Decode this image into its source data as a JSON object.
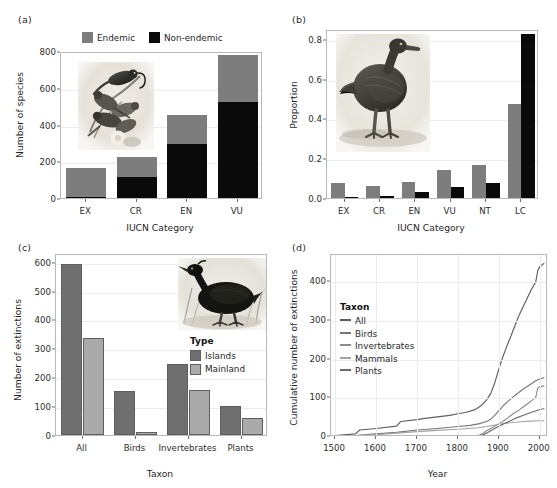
{
  "figure": {
    "panels": [
      "(a)",
      "(b)",
      "(c)",
      "(d)"
    ]
  },
  "colors": {
    "endemic_grey": "#7d7d7d",
    "non_endemic_black": "#0a0a0a",
    "islands_dark": "#6f6f6f",
    "mainland_light": "#aaaaaa",
    "axis": "#b9b9b9",
    "grid": "#ececec",
    "text": "#1f1f1f",
    "line_all": "#5f5f5f",
    "line_birds": "#777777",
    "line_invertebrates": "#8c8c8c",
    "line_mammals": "#a3a3a3",
    "line_plants": "#6a6a6a"
  },
  "panel_a": {
    "label": "(a)",
    "legend": {
      "entries": [
        {
          "label": "Endemic",
          "color": "#7d7d7d"
        },
        {
          "label": "Non-endemic",
          "color": "#0a0a0a"
        }
      ]
    },
    "chart_data": {
      "type": "bar",
      "stacked": true,
      "title": "",
      "xlabel": "IUCN Category",
      "ylabel": "Number of species",
      "categories": [
        "EX",
        "CR",
        "EN",
        "VU"
      ],
      "ylim": [
        0,
        800
      ],
      "yticks": [
        0,
        200,
        400,
        600,
        800
      ],
      "grid": true,
      "legend_position": "top",
      "series": [
        {
          "name": "Non-endemic",
          "color": "#0a0a0a",
          "values": [
            8,
            112,
            292,
            522
          ]
        },
        {
          "name": "Endemic",
          "color": "#7d7d7d",
          "values": [
            155,
            113,
            158,
            255
          ]
        }
      ],
      "totals": [
        163,
        225,
        450,
        777
      ]
    }
  },
  "panel_b": {
    "label": "(b)",
    "chart_data": {
      "type": "bar",
      "stacked": false,
      "grouped": true,
      "title": "",
      "xlabel": "IUCN Category",
      "ylabel": "Proportion",
      "categories": [
        "EX",
        "CR",
        "EN",
        "VU",
        "NT",
        "LC"
      ],
      "ylim": [
        0,
        0.85
      ],
      "yticks": [
        0.0,
        0.2,
        0.4,
        0.6,
        0.8
      ],
      "ytick_labels": [
        "0.0",
        "0.2",
        "0.4",
        "0.6",
        "0.8"
      ],
      "grid": true,
      "series": [
        {
          "name": "Endemic",
          "color": "#7d7d7d",
          "values": [
            0.077,
            0.058,
            0.083,
            0.139,
            0.165,
            0.472
          ]
        },
        {
          "name": "Non-endemic",
          "color": "#0a0a0a",
          "values": [
            0.002,
            0.012,
            0.028,
            0.055,
            0.077,
            0.826
          ]
        }
      ]
    }
  },
  "panel_c": {
    "label": "(c)",
    "legend": {
      "title": "Type",
      "entries": [
        {
          "label": "Islands",
          "color": "#6f6f6f"
        },
        {
          "label": "Mainland",
          "color": "#aaaaaa"
        }
      ]
    },
    "chart_data": {
      "type": "bar",
      "stacked": false,
      "grouped": true,
      "title": "",
      "xlabel": "Taxon",
      "ylabel": "Number of extinctions",
      "categories": [
        "All",
        "Birds",
        "Invertebrates",
        "Plants"
      ],
      "ylim": [
        0,
        630
      ],
      "yticks": [
        0,
        100,
        200,
        300,
        400,
        500,
        600
      ],
      "grid": true,
      "legend_position": "inside-right",
      "series": [
        {
          "name": "Islands",
          "color": "#6f6f6f",
          "values": [
            591,
            153,
            247,
            100
          ]
        },
        {
          "name": "Mainland",
          "color": "#aaaaaa",
          "values": [
            336,
            10,
            155,
            58
          ]
        }
      ]
    }
  },
  "panel_d": {
    "label": "(d)",
    "legend": {
      "title": "Taxon",
      "entries": [
        {
          "label": "All",
          "color": "#5f5f5f"
        },
        {
          "label": "Birds",
          "color": "#777777"
        },
        {
          "label": "Invertebrates",
          "color": "#8c8c8c"
        },
        {
          "label": "Mammals",
          "color": "#a3a3a3"
        },
        {
          "label": "Plants",
          "color": "#6a6a6a"
        }
      ]
    },
    "chart_data": {
      "type": "line",
      "title": "",
      "xlabel": "Year",
      "ylabel": "Cumulative number of extinctions",
      "xlim": [
        1490,
        2020
      ],
      "ylim": [
        0,
        470
      ],
      "xticks": [
        1500,
        1600,
        1700,
        1800,
        1900,
        2000
      ],
      "yticks": [
        0,
        100,
        200,
        300,
        400
      ],
      "grid": true,
      "legend_position": "inside-left",
      "series": [
        {
          "name": "All",
          "color": "#5f5f5f",
          "x": [
            1500,
            1550,
            1560,
            1600,
            1650,
            1660,
            1700,
            1720,
            1750,
            1780,
            1800,
            1820,
            1840,
            1850,
            1860,
            1870,
            1880,
            1890,
            1900,
            1910,
            1920,
            1930,
            1940,
            1950,
            1960,
            1970,
            1980,
            1990,
            1995,
            2000,
            2010
          ],
          "y": [
            4,
            8,
            18,
            22,
            28,
            40,
            45,
            48,
            52,
            56,
            60,
            64,
            70,
            76,
            84,
            96,
            112,
            140,
            176,
            208,
            236,
            262,
            290,
            316,
            338,
            360,
            382,
            400,
            430,
            440,
            448
          ]
        },
        {
          "name": "Birds",
          "color": "#777777",
          "x": [
            1500,
            1550,
            1600,
            1650,
            1700,
            1750,
            1800,
            1830,
            1850,
            1870,
            1880,
            1890,
            1900,
            1910,
            1920,
            1930,
            1940,
            1950,
            1960,
            1970,
            1980,
            1990,
            2000,
            2010
          ],
          "y": [
            2,
            4,
            8,
            12,
            18,
            22,
            27,
            30,
            34,
            40,
            46,
            56,
            68,
            80,
            90,
            99,
            108,
            116,
            124,
            131,
            138,
            145,
            150,
            153
          ]
        },
        {
          "name": "Invertebrates",
          "color": "#8c8c8c",
          "x": [
            1500,
            1600,
            1700,
            1800,
            1830,
            1850,
            1860,
            1870,
            1880,
            1890,
            1900,
            1910,
            1920,
            1930,
            1940,
            1950,
            1960,
            1970,
            1980,
            1990,
            1995,
            2000,
            2010
          ],
          "y": [
            0,
            0,
            0,
            1,
            2,
            4,
            8,
            16,
            22,
            28,
            34,
            40,
            48,
            56,
            64,
            70,
            78,
            86,
            94,
            102,
            126,
            130,
            132
          ]
        },
        {
          "name": "Mammals",
          "color": "#a3a3a3",
          "x": [
            1500,
            1550,
            1600,
            1650,
            1700,
            1750,
            1800,
            1850,
            1870,
            1880,
            1890,
            1900,
            1920,
            1940,
            1960,
            1980,
            2000,
            2010
          ],
          "y": [
            1,
            3,
            6,
            10,
            14,
            17,
            20,
            24,
            27,
            29,
            31,
            33,
            36,
            38,
            40,
            41,
            42,
            42
          ]
        },
        {
          "name": "Plants",
          "color": "#6a6a6a",
          "x": [
            1500,
            1600,
            1700,
            1800,
            1840,
            1860,
            1870,
            1880,
            1890,
            1900,
            1920,
            1940,
            1960,
            1980,
            2000,
            2010
          ],
          "y": [
            0,
            0,
            0,
            1,
            2,
            5,
            10,
            16,
            22,
            28,
            38,
            48,
            56,
            64,
            71,
            73
          ]
        }
      ]
    }
  }
}
